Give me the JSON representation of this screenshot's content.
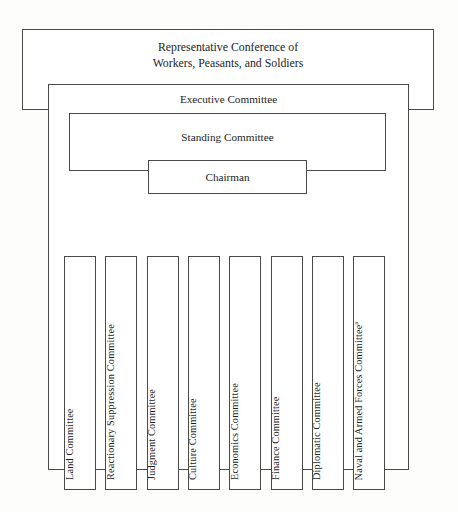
{
  "diagram": {
    "title_text": "Organizational chart of the Representative Conference of Workers, Peasants, and Soldiers",
    "colors": {
      "background": "#fdfdfc",
      "box_fill": "#ffffff",
      "box_border": "#4a4a4a",
      "text": "#1d1d1d"
    }
  },
  "tiers": {
    "conference": {
      "label": "Representative Conference of\nWorkers, Peasants, and Soldiers"
    },
    "executive": {
      "label": "Executive Committee"
    },
    "standing": {
      "label": "Standing Committee"
    },
    "chairman": {
      "label": "Chairman"
    }
  },
  "committees": [
    {
      "label": "Land Committee",
      "footnote": ""
    },
    {
      "label": "Reactionary Suppression Committee",
      "footnote": ""
    },
    {
      "label": "Judgment Committee",
      "footnote": ""
    },
    {
      "label": "Culture Committee",
      "footnote": ""
    },
    {
      "label": "Economics Committee",
      "footnote": ""
    },
    {
      "label": "Finance Committee",
      "footnote": ""
    },
    {
      "label": "Diplomatic Committee",
      "footnote": ""
    },
    {
      "label": "Naval and Armed Forces Committee",
      "footnote": "a"
    }
  ]
}
